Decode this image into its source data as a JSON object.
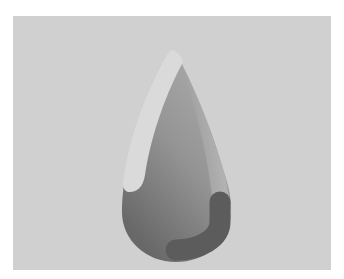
{
  "image": {
    "description": "Water drop logo on gray panel",
    "colors": {
      "page_background": "#ffffff",
      "panel": "#d0d0d0",
      "highlight": "#dadada",
      "drop_light": "#a4a4a4",
      "drop_mid": "#8c8c8c",
      "drop_dark": "#6c6c6c",
      "hook": "#5c5c5c"
    }
  }
}
